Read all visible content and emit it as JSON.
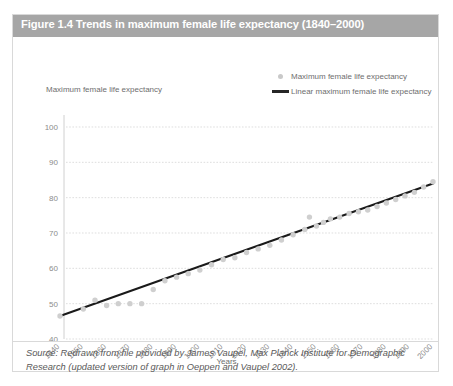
{
  "figure": {
    "title": "Figure 1.4 Trends in maximum female life expectancy (1840–2000)",
    "title_bar_color": "#a6a6a6",
    "border_color": "#d9d9d9",
    "source_note": "Source: Redrawn from file provided by James Vaupel, Max Planck Institute for Demographic Research (updated version of graph in Oeppen and Vaupel 2002)."
  },
  "legend": {
    "position": "top-right",
    "items": [
      {
        "label": "Maximum female life expectancy",
        "marker": "circle",
        "color": "#c9c9c9"
      },
      {
        "label": "Linear maximum female life expectancy",
        "marker": "line",
        "color": "#262626"
      }
    ]
  },
  "chart_data": {
    "type": "scatter",
    "title": "Figure 1.4 Trends in maximum female life expectancy (1840–2000)",
    "xlabel": "Years",
    "ylabel": "Maximum female life expectancy",
    "xlim": [
      1840,
      2000
    ],
    "ylim": [
      40,
      100
    ],
    "xticks": [
      1840,
      1850,
      1860,
      1870,
      1880,
      1890,
      1900,
      1910,
      1920,
      1930,
      1940,
      1950,
      1960,
      1970,
      1980,
      1990,
      2000
    ],
    "yticks": [
      40,
      50,
      60,
      70,
      80,
      90,
      100
    ],
    "grid": true,
    "xtick_rotation": 45,
    "series": [
      {
        "name": "Maximum female life expectancy",
        "type": "scatter",
        "marker": "circle",
        "color": "#cfcfcf",
        "x": [
          1840,
          1850,
          1855,
          1860,
          1865,
          1870,
          1875,
          1880,
          1885,
          1890,
          1895,
          1900,
          1905,
          1910,
          1915,
          1920,
          1925,
          1930,
          1935,
          1940,
          1945,
          1947,
          1950,
          1953,
          1956,
          1960,
          1964,
          1968,
          1972,
          1976,
          1980,
          1984,
          1988,
          1992,
          1996,
          2000
        ],
        "y": [
          46.5,
          48.5,
          51.0,
          49.5,
          50.0,
          50.0,
          50.0,
          54.0,
          56.5,
          57.5,
          58.5,
          59.5,
          61.0,
          62.5,
          63.0,
          64.5,
          65.5,
          66.5,
          68.0,
          69.5,
          71.0,
          74.5,
          72.0,
          73.0,
          74.0,
          74.5,
          75.5,
          76.0,
          76.5,
          77.5,
          78.5,
          79.5,
          80.5,
          81.5,
          83.0,
          84.5
        ]
      },
      {
        "name": "Linear maximum female life expectancy",
        "type": "line",
        "color": "#1a1a1a",
        "x": [
          1840,
          2000
        ],
        "y": [
          46.5,
          84.0
        ]
      }
    ]
  }
}
